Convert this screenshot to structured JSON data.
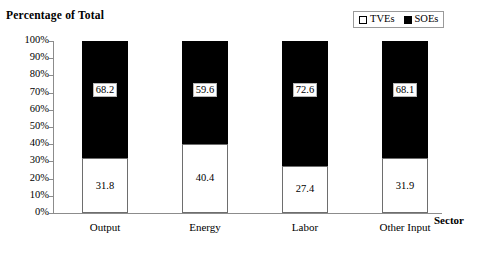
{
  "chart_data": {
    "type": "bar",
    "subtype": "stacked-100-percent",
    "title": "Percentage of Total",
    "xlabel": "Sector",
    "ylabel": "",
    "categories": [
      "Output",
      "Energy",
      "Labor",
      "Other Input"
    ],
    "series": [
      {
        "name": "TVEs",
        "color": "#ffffff",
        "values": [
          31.8,
          40.4,
          27.4,
          31.9
        ],
        "labels": [
          "31.8",
          "40.4",
          "27.4",
          "31.9"
        ]
      },
      {
        "name": "SOEs",
        "color": "#000000",
        "values": [
          68.2,
          59.6,
          72.6,
          68.1
        ],
        "labels": [
          "68.2",
          "59.6",
          "72.6",
          "68.1"
        ]
      }
    ],
    "ylim": [
      0,
      100
    ],
    "ytick_labels": [
      "100%",
      "90%",
      "80%",
      "70%",
      "60%",
      "50%",
      "40%",
      "30%",
      "20%",
      "10%",
      "0%"
    ],
    "ytick_values": [
      100,
      90,
      80,
      70,
      60,
      50,
      40,
      30,
      20,
      10,
      0
    ],
    "grid": false,
    "legend_position": "top-right",
    "legend_entries": [
      {
        "label": "TVEs",
        "swatch": "white-square"
      },
      {
        "label": "SOEs",
        "swatch": "black-square"
      }
    ]
  }
}
